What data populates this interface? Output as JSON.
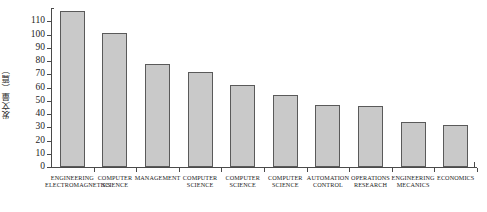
{
  "chart_data": {
    "type": "bar",
    "title": "",
    "xlabel": "",
    "ylabel": "发文量（篇）",
    "ylim": [
      0,
      120
    ],
    "grid": false,
    "legend": null,
    "y_ticks": [
      0,
      10,
      20,
      30,
      40,
      50,
      60,
      70,
      80,
      90,
      100,
      110
    ],
    "categories": [
      "ENGINEERING ELECTROMAGNETICS",
      "COMPUTER SCIENCE",
      "MANAGEMENT",
      "COMPUTER SCIENCE",
      "COMPUTER SCIENCE",
      "COMPUTER SCIENCE",
      "AUTOMATION CONTROL",
      "OPERATIONS RESEARCH",
      "ENGINEERING MECANICS",
      "ECONOMICS"
    ],
    "category_lines": [
      [
        "ENGINEERING",
        "ELECTROMAGNETICS"
      ],
      [
        "COMPUTER",
        "SCIENCE"
      ],
      [
        "MANAGEMENT"
      ],
      [
        "COMPUTER",
        "SCIENCE"
      ],
      [
        "COMPUTER",
        "SCIENCE"
      ],
      [
        "COMPUTER",
        "SCIENCE"
      ],
      [
        "AUTOMATION",
        "CONTROL"
      ],
      [
        "OPERATIONS",
        "RESEARCH"
      ],
      [
        "ENGINEERING",
        "MECANICS"
      ],
      [
        "ECONOMICS"
      ]
    ],
    "values": [
      118,
      101,
      78,
      72,
      62,
      54,
      47,
      46,
      34,
      32
    ],
    "bar_color": "#c9c9c9",
    "bar_border_color": "#5a5a5a",
    "axis_color": "#4a4a4a"
  }
}
